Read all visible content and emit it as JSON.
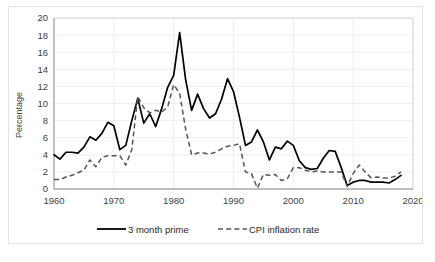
{
  "chart_data": {
    "type": "line",
    "title": "",
    "xlabel": "",
    "ylabel": "Percentage",
    "xlim": [
      1960,
      2020
    ],
    "ylim": [
      0,
      20
    ],
    "xticks": [
      1960,
      1970,
      1980,
      1990,
      2000,
      2010,
      2020
    ],
    "yticks": [
      0,
      2,
      4,
      6,
      8,
      10,
      12,
      14,
      16,
      18,
      20
    ],
    "grid": true,
    "legend_position": "bottom-center",
    "x": [
      1960,
      1961,
      1962,
      1963,
      1964,
      1965,
      1966,
      1967,
      1968,
      1969,
      1970,
      1971,
      1972,
      1973,
      1974,
      1975,
      1976,
      1977,
      1978,
      1979,
      1980,
      1981,
      1982,
      1983,
      1984,
      1985,
      1986,
      1987,
      1988,
      1989,
      1990,
      1991,
      1992,
      1993,
      1994,
      1995,
      1996,
      1997,
      1998,
      1999,
      2000,
      2001,
      2002,
      2003,
      2004,
      2005,
      2006,
      2007,
      2008,
      2009,
      2010,
      2011,
      2012,
      2013,
      2014,
      2015,
      2016,
      2017,
      2018
    ],
    "series": [
      {
        "name": "3 month prime",
        "style": "solid",
        "color": "#000000",
        "values": [
          4.0,
          3.5,
          4.3,
          4.3,
          4.2,
          4.9,
          6.1,
          5.7,
          6.5,
          7.8,
          7.4,
          4.6,
          5.1,
          8.0,
          10.6,
          7.7,
          8.8,
          7.3,
          9.4,
          11.9,
          13.3,
          18.3,
          12.8,
          9.2,
          11.1,
          9.4,
          8.3,
          8.8,
          10.5,
          12.9,
          11.4,
          8.4,
          5.1,
          5.5,
          6.9,
          5.5,
          3.4,
          4.9,
          4.7,
          5.6,
          5.1,
          3.3,
          2.5,
          2.3,
          2.4,
          3.6,
          4.5,
          4.4,
          2.5,
          0.4,
          0.8,
          1.0,
          1.0,
          0.8,
          0.8,
          0.8,
          0.7,
          1.1,
          1.6
        ]
      },
      {
        "name": "CPI inflation rate",
        "style": "dashed",
        "color": "#555555",
        "values": [
          1.1,
          1.1,
          1.4,
          1.6,
          1.9,
          2.2,
          3.4,
          2.6,
          3.7,
          3.9,
          3.9,
          3.9,
          2.8,
          4.6,
          10.8,
          9.5,
          8.9,
          9.2,
          9.0,
          9.6,
          12.2,
          11.2,
          7.0,
          4.0,
          4.2,
          4.2,
          4.1,
          4.3,
          4.7,
          5.0,
          5.1,
          5.3,
          2.0,
          1.8,
          0.1,
          1.7,
          1.6,
          1.7,
          1.0,
          1.2,
          2.5,
          2.5,
          2.2,
          2.0,
          2.1,
          2.0,
          2.0,
          2.0,
          2.0,
          0.3,
          1.8,
          2.8,
          2.0,
          1.3,
          1.4,
          1.3,
          1.3,
          1.5,
          2.0
        ]
      }
    ]
  },
  "legend": {
    "items": [
      {
        "label": "3 month prime"
      },
      {
        "label": "CPI inflation rate"
      }
    ]
  },
  "axes": {
    "y_title": "Percentage",
    "y_labels": [
      "20",
      "18",
      "16",
      "14",
      "12",
      "10",
      "8",
      "6",
      "4",
      "2",
      "0"
    ],
    "x_labels": [
      "1960",
      "1970",
      "1980",
      "1990",
      "2000",
      "2010",
      "2020"
    ]
  },
  "colors": {
    "series_primary": "#000000",
    "series_secondary": "#555555",
    "grid": "#e8e8e8",
    "text": "#3f3f3f",
    "background": "#ffffff"
  }
}
